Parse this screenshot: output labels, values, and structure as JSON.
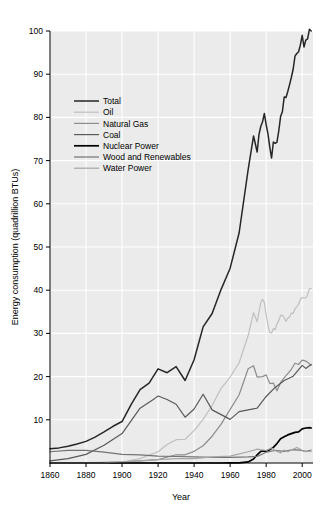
{
  "chart_data": {
    "type": "line",
    "title": "",
    "xlabel": "Year",
    "ylabel": "Energy consumption (quadrillion BTUs)",
    "xlim": [
      1860,
      2006
    ],
    "ylim": [
      0,
      100
    ],
    "xticks": [
      1860,
      1880,
      1900,
      1920,
      1940,
      1960,
      1980,
      2000
    ],
    "yticks": [
      10,
      20,
      30,
      40,
      50,
      60,
      70,
      80,
      90,
      100
    ],
    "grid": true,
    "legend_position": "upper-left-inside",
    "plot_background": "#ebebeb",
    "grid_color": "#ffffff",
    "series": [
      {
        "name": "Total",
        "color": "#262626",
        "width": 1.5,
        "x": [
          1860,
          1865,
          1870,
          1875,
          1880,
          1885,
          1890,
          1895,
          1900,
          1905,
          1910,
          1915,
          1920,
          1925,
          1930,
          1935,
          1940,
          1945,
          1950,
          1955,
          1960,
          1965,
          1970,
          1973,
          1975,
          1976,
          1977,
          1978,
          1979,
          1980,
          1981,
          1982,
          1983,
          1984,
          1985,
          1986,
          1987,
          1988,
          1989,
          1990,
          1991,
          1992,
          1993,
          1994,
          1995,
          1996,
          1997,
          1998,
          1999,
          2000,
          2001,
          2002,
          2003,
          2004,
          2005
        ],
        "y": [
          3.3,
          3.5,
          3.9,
          4.4,
          5.0,
          6.0,
          7.2,
          8.5,
          9.6,
          13.5,
          17.0,
          18.5,
          21.8,
          20.9,
          22.3,
          19.1,
          23.9,
          31.5,
          34.6,
          40.2,
          45.1,
          53.3,
          67.9,
          75.7,
          72.0,
          76.0,
          77.9,
          79.0,
          80.9,
          78.3,
          76.2,
          73.1,
          70.6,
          74.3,
          74.0,
          74.3,
          76.9,
          80.2,
          81.3,
          84.7,
          84.6,
          86.0,
          87.6,
          89.3,
          91.2,
          94.2,
          94.8,
          95.2,
          96.8,
          99.0,
          96.3,
          97.9,
          98.2,
          100.4,
          100.0
        ]
      },
      {
        "name": "Oil",
        "color": "#bfbfbf",
        "width": 1.2,
        "x": [
          1860,
          1880,
          1900,
          1910,
          1920,
          1925,
          1930,
          1935,
          1940,
          1945,
          1950,
          1955,
          1960,
          1965,
          1970,
          1973,
          1975,
          1977,
          1978,
          1979,
          1980,
          1981,
          1982,
          1983,
          1984,
          1985,
          1986,
          1987,
          1988,
          1989,
          1990,
          1991,
          1992,
          1993,
          1994,
          1995,
          1996,
          1997,
          1998,
          1999,
          2000,
          2001,
          2002,
          2003,
          2004,
          2005
        ],
        "y": [
          0.0,
          0.1,
          0.2,
          1.0,
          2.6,
          4.3,
          5.4,
          5.5,
          7.5,
          10.1,
          13.3,
          17.3,
          19.9,
          23.2,
          29.5,
          34.8,
          32.7,
          37.1,
          37.9,
          37.1,
          34.2,
          31.9,
          30.2,
          30.1,
          31.1,
          30.9,
          32.2,
          32.9,
          34.2,
          34.2,
          33.6,
          32.8,
          33.5,
          33.8,
          34.7,
          34.6,
          35.7,
          36.2,
          36.8,
          37.9,
          38.3,
          38.2,
          38.2,
          39.0,
          40.3,
          40.4
        ]
      },
      {
        "name": "Natural Gas",
        "color": "#8c8c8c",
        "width": 1.2,
        "x": [
          1860,
          1880,
          1900,
          1910,
          1920,
          1930,
          1935,
          1940,
          1945,
          1950,
          1955,
          1960,
          1965,
          1970,
          1973,
          1975,
          1978,
          1980,
          1982,
          1984,
          1986,
          1988,
          1990,
          1992,
          1994,
          1996,
          1998,
          2000,
          2002,
          2004,
          2005
        ],
        "y": [
          0.0,
          0.0,
          0.25,
          0.5,
          0.8,
          1.9,
          1.9,
          2.7,
          4.0,
          6.2,
          9.0,
          12.4,
          15.8,
          21.8,
          22.5,
          19.9,
          20.0,
          20.4,
          18.4,
          18.5,
          16.7,
          18.6,
          19.7,
          20.7,
          21.7,
          23.1,
          22.8,
          23.8,
          23.6,
          23.0,
          22.6
        ]
      },
      {
        "name": "Coal",
        "color": "#595959",
        "width": 1.2,
        "x": [
          1860,
          1870,
          1880,
          1890,
          1900,
          1910,
          1918,
          1920,
          1925,
          1930,
          1935,
          1940,
          1945,
          1950,
          1955,
          1960,
          1965,
          1970,
          1975,
          1980,
          1985,
          1990,
          1995,
          2000,
          2002,
          2004,
          2005
        ],
        "y": [
          0.5,
          1.0,
          2.0,
          4.1,
          6.8,
          12.7,
          14.9,
          15.5,
          14.7,
          13.6,
          10.6,
          12.5,
          15.9,
          12.3,
          11.2,
          10.1,
          11.9,
          12.3,
          12.7,
          15.4,
          17.5,
          19.1,
          20.1,
          22.6,
          21.9,
          22.5,
          22.8
        ]
      },
      {
        "name": "Nuclear Power",
        "color": "#000000",
        "width": 1.7,
        "x": [
          1860,
          1955,
          1960,
          1965,
          1970,
          1973,
          1975,
          1977,
          1979,
          1980,
          1982,
          1984,
          1986,
          1988,
          1990,
          1992,
          1994,
          1996,
          1998,
          2000,
          2002,
          2004,
          2005
        ],
        "y": [
          0.0,
          0.0,
          0.01,
          0.04,
          0.24,
          0.91,
          1.9,
          2.7,
          2.8,
          2.7,
          3.1,
          3.6,
          4.5,
          5.6,
          6.1,
          6.5,
          6.8,
          7.1,
          7.2,
          7.9,
          8.1,
          8.2,
          8.1
        ]
      },
      {
        "name": "Wood and Renewables",
        "color": "#737373",
        "width": 1.2,
        "x": [
          1860,
          1870,
          1880,
          1890,
          1900,
          1910,
          1920,
          1930,
          1940,
          1950,
          1960,
          1970,
          1975,
          1980,
          1985,
          1990,
          1995,
          2000,
          2002,
          2004,
          2005
        ],
        "y": [
          2.6,
          2.9,
          2.9,
          2.5,
          2.0,
          1.9,
          1.6,
          1.5,
          1.4,
          1.3,
          1.3,
          1.4,
          1.5,
          2.5,
          2.9,
          2.7,
          3.1,
          2.9,
          2.7,
          2.9,
          3.0
        ]
      },
      {
        "name": "Water Power",
        "color": "#a6a6a6",
        "width": 1.2,
        "x": [
          1860,
          1880,
          1890,
          1900,
          1910,
          1920,
          1930,
          1940,
          1950,
          1960,
          1970,
          1975,
          1980,
          1983,
          1985,
          1988,
          1990,
          1992,
          1995,
          1997,
          1999,
          2000,
          2002,
          2004,
          2005
        ],
        "y": [
          0.0,
          0.0,
          0.05,
          0.25,
          0.5,
          0.8,
          1.0,
          1.0,
          1.4,
          1.6,
          2.6,
          3.2,
          2.9,
          3.5,
          2.9,
          2.3,
          3.0,
          2.6,
          3.2,
          3.6,
          3.2,
          2.8,
          2.6,
          2.7,
          2.7
        ]
      }
    ]
  },
  "legend": {
    "items": [
      {
        "label": "Total"
      },
      {
        "label": "Oil"
      },
      {
        "label": "Natural Gas"
      },
      {
        "label": "Coal"
      },
      {
        "label": "Nuclear Power"
      },
      {
        "label": "Wood and Renewables"
      },
      {
        "label": "Water Power"
      }
    ]
  }
}
